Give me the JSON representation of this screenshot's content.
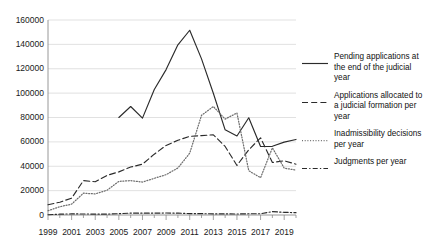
{
  "chart_data": {
    "type": "line",
    "title": "",
    "xlabel": "",
    "ylabel": "",
    "x": [
      1999,
      2000,
      2001,
      2002,
      2003,
      2004,
      2005,
      2006,
      2007,
      2008,
      2009,
      2010,
      2011,
      2012,
      2013,
      2014,
      2015,
      2016,
      2017,
      2018,
      2019,
      2020
    ],
    "xticks": [
      "1999",
      "2001",
      "2003",
      "2005",
      "2007",
      "2009",
      "2011",
      "2013",
      "2015",
      "2017",
      "2019"
    ],
    "yticks": [
      "0",
      "20000",
      "40000",
      "60000",
      "80000",
      "100000",
      "120000",
      "140000",
      "160000"
    ],
    "ylim": [
      0,
      160000
    ],
    "xlim": [
      1999,
      2020
    ],
    "grid": true,
    "legend_position": "right",
    "series": [
      {
        "name": "Pending applications at the end of the judicial year",
        "style": "solid",
        "color": "#2b2b2b",
        "x": [
          2005,
          2006,
          2007,
          2008,
          2009,
          2010,
          2011,
          2012,
          2013,
          2014,
          2015,
          2016,
          2017,
          2018,
          2019,
          2020
        ],
        "values": [
          80000,
          89000,
          79500,
          103000,
          119300,
          139600,
          151600,
          128100,
          99900,
          69900,
          64850,
          79750,
          56250,
          56350,
          59800,
          62000
        ]
      },
      {
        "name": "Applications allocated to a judicial formation per year",
        "style": "dashed",
        "color": "#2b2b2b",
        "x": [
          1999,
          2000,
          2001,
          2002,
          2003,
          2004,
          2005,
          2006,
          2007,
          2008,
          2009,
          2010,
          2011,
          2012,
          2013,
          2014,
          2015,
          2016,
          2017,
          2018,
          2019,
          2020
        ],
        "values": [
          8400,
          10500,
          13850,
          28200,
          27300,
          32500,
          35400,
          39350,
          41700,
          49900,
          57100,
          61300,
          64500,
          65150,
          65800,
          56250,
          40650,
          53500,
          63350,
          43100,
          44500,
          41700
        ]
      },
      {
        "name": "Inadmissibility decisions per year",
        "style": "dotted",
        "color": "#6f6f6f",
        "x": [
          1999,
          2000,
          2001,
          2002,
          2003,
          2004,
          2005,
          2006,
          2007,
          2008,
          2009,
          2010,
          2011,
          2012,
          2013,
          2014,
          2015,
          2016,
          2017,
          2018,
          2019,
          2020
        ],
        "values": [
          3500,
          6800,
          8900,
          17900,
          17300,
          20350,
          27600,
          28200,
          27000,
          30100,
          33100,
          38600,
          50700,
          81800,
          89000,
          78700,
          83700,
          36300,
          30600,
          55100,
          38500,
          36800
        ]
      },
      {
        "name": "Judgments per year",
        "style": "dashdot",
        "color": "#2b2b2b",
        "x": [
          1999,
          2000,
          2001,
          2002,
          2003,
          2004,
          2005,
          2006,
          2007,
          2008,
          2009,
          2010,
          2011,
          2012,
          2013,
          2014,
          2015,
          2016,
          2017,
          2018,
          2019,
          2020
        ],
        "values": [
          177,
          695,
          889,
          844,
          703,
          718,
          1105,
          1560,
          1503,
          1543,
          1625,
          1499,
          1157,
          1093,
          916,
          891,
          823,
          993,
          1068,
          2738,
          2187,
          1901
        ]
      }
    ]
  },
  "legend": {
    "items": [
      {
        "label": "Pending applications at the end of the judicial year",
        "style": "solid"
      },
      {
        "label": "Applications allocated to a judicial formation per year",
        "style": "dashed"
      },
      {
        "label": "Inadmissibility decisions per year",
        "style": "dotted"
      },
      {
        "label": "Judgments per year",
        "style": "dashdot"
      }
    ]
  }
}
